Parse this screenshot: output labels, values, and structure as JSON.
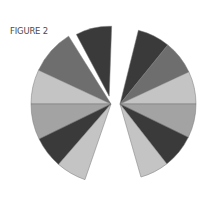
{
  "figure": {
    "title": "FIGURE 2"
  },
  "colors": {
    "dark": "#3a3a3a",
    "medium": "#6e6e6e",
    "light": "#c4c4c4",
    "light_medium": "#a3a3a3"
  },
  "chart_data": {
    "type": "pie",
    "title": "FIGURE 2",
    "legend": "none",
    "series": [
      {
        "name": "left fan",
        "apex": [
          111,
          104
        ],
        "radius": 80,
        "slices": [
          {
            "shade": "dark",
            "start_deg": -118,
            "end_deg": -88,
            "exploded": true
          },
          {
            "shade": "medium",
            "start_deg": -155,
            "end_deg": -122,
            "exploded": false
          },
          {
            "shade": "light",
            "start_deg": 180,
            "end_deg": 205,
            "exploded": false
          },
          {
            "shade": "light_medium",
            "start_deg": 154,
            "end_deg": 180,
            "exploded": false
          },
          {
            "shade": "dark",
            "start_deg": 131,
            "end_deg": 154,
            "exploded": false
          },
          {
            "shade": "light",
            "start_deg": 109,
            "end_deg": 131,
            "exploded": false
          }
        ]
      },
      {
        "name": "right fan",
        "apex": [
          120,
          104
        ],
        "radius": 76,
        "slices": [
          {
            "shade": "dark",
            "start_deg": -76,
            "end_deg": -51,
            "exploded": false
          },
          {
            "shade": "medium",
            "start_deg": -51,
            "end_deg": -25,
            "exploded": false
          },
          {
            "shade": "light",
            "start_deg": -25,
            "end_deg": 0,
            "exploded": false
          },
          {
            "shade": "light_medium",
            "start_deg": 0,
            "end_deg": 26,
            "exploded": false
          },
          {
            "shade": "dark",
            "start_deg": 26,
            "end_deg": 52,
            "exploded": false
          },
          {
            "shade": "light",
            "start_deg": 52,
            "end_deg": 74,
            "exploded": false
          }
        ]
      }
    ],
    "slice_angle_shares_deg": {
      "left": [
        30,
        33,
        25,
        26,
        23,
        22
      ],
      "right": [
        25,
        26,
        25,
        26,
        26,
        22
      ]
    }
  }
}
